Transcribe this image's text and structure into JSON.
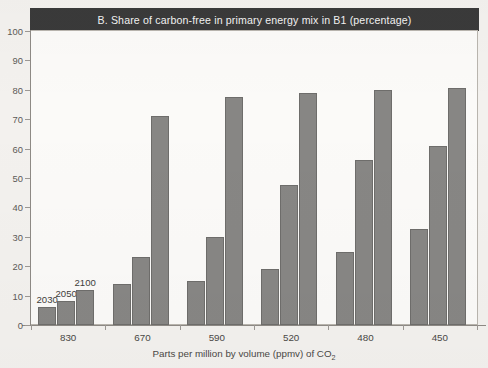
{
  "chart_data": {
    "type": "bar",
    "title": "B.  Share of carbon-free in primary energy mix in B1 (percentage)",
    "xlabel": "Parts per million by volume (ppmv) of CO₂",
    "ylabel": "",
    "ylim": [
      0,
      100
    ],
    "yticks": [
      0,
      10,
      20,
      30,
      40,
      50,
      60,
      70,
      80,
      90,
      100
    ],
    "grid": false,
    "legend_position": "inline-annotations",
    "categories": [
      "830",
      "670",
      "590",
      "520",
      "480",
      "450"
    ],
    "series": [
      {
        "name": "2030",
        "values": [
          6,
          14,
          15,
          19,
          25,
          32.5
        ]
      },
      {
        "name": "2050",
        "values": [
          8,
          23,
          30,
          47.5,
          56,
          61
        ]
      },
      {
        "name": "2100",
        "values": [
          12,
          71,
          77.5,
          79,
          80,
          80.5
        ]
      }
    ],
    "annotations": [
      {
        "text": "2030",
        "series": "2030",
        "category": "830"
      },
      {
        "text": "2050",
        "series": "2050",
        "category": "830"
      },
      {
        "text": "2100",
        "series": "2100",
        "category": "830"
      }
    ],
    "bar_color": "#878684",
    "bar_edge_color": "#6e6d6b",
    "title_band_color": "#3a3a3a",
    "plot_background": "#fbfaf8",
    "page_background": "#f3f1ee"
  },
  "axis": {
    "y_tick_labels": [
      "100",
      "90",
      "80",
      "70",
      "60",
      "50",
      "40",
      "30",
      "20",
      "10",
      "0"
    ],
    "x_tick_labels": [
      "830",
      "670",
      "590",
      "520",
      "480",
      "450"
    ],
    "x_title_main": "Parts per million by volume (ppmv) of CO",
    "x_title_sub": "2"
  },
  "annotations": {
    "a2030": "2030",
    "a2050": "2050",
    "a2100": "2100"
  }
}
